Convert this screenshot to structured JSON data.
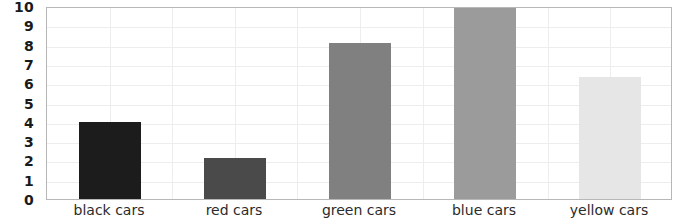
{
  "chart_data": {
    "type": "bar",
    "title": "",
    "subtitle": "",
    "xlabel": "",
    "ylabel": "",
    "categories": [
      "black cars",
      "red cars",
      "green cars",
      "blue cars",
      "yellow cars"
    ],
    "values": [
      4,
      2.1,
      8.1,
      10,
      6.3
    ],
    "series": [
      {
        "name": "cars",
        "values": [
          4,
          2.1,
          8.1,
          10,
          6.3
        ]
      }
    ],
    "ylim": [
      0,
      10
    ],
    "ytick_labels": [
      "0",
      "1",
      "2",
      "3",
      "4",
      "5",
      "6",
      "7",
      "8",
      "9",
      "10"
    ],
    "ytick_values": [
      0,
      1,
      2,
      3,
      4,
      5,
      6,
      7,
      8,
      9,
      10
    ],
    "grid": true,
    "grid_axis": "both",
    "legend": false,
    "legend_position": "none",
    "bar_colors": [
      "#1c1c1c",
      "#4a4a4a",
      "#808080",
      "#9b9b9b",
      "#e6e6e6"
    ],
    "grid_color": "#ededed",
    "frame_color": "#b7b7b7",
    "background_color": "#ffffff",
    "tick_label_color": "#1a1a1a",
    "category_label_color": "#2b2b2b"
  }
}
